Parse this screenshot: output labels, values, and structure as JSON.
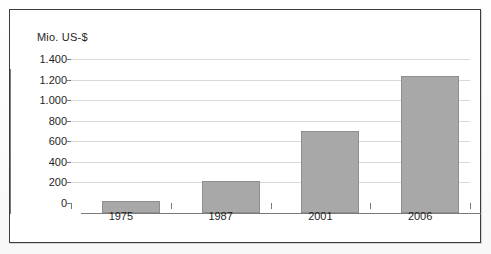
{
  "chart_data": {
    "type": "bar",
    "title": "",
    "subtitle": "",
    "xlabel": "",
    "ylabel": "Mio. US-$",
    "categories": [
      "1975",
      "1987",
      "2001",
      "2006"
    ],
    "values": [
      120,
      310,
      800,
      1330
    ],
    "ylim": [
      0,
      1400
    ],
    "ytick_labels": [
      "0",
      "200",
      "400",
      "600",
      "800",
      "1.000",
      "1.200",
      "1.400"
    ],
    "ytick_values": [
      0,
      200,
      400,
      600,
      800,
      1000,
      1200,
      1400
    ],
    "grid": true,
    "legend": false,
    "legend_position": "none",
    "series": [
      {
        "name": "",
        "values": [
          120,
          310,
          800,
          1330
        ],
        "color": "#a8a8a8"
      }
    ],
    "annotations": []
  },
  "colors": {
    "bar_fill": "#a8a8a8",
    "bar_stroke": "#8e8e8e",
    "gridline": "#d9d9d9",
    "axis": "#7a7a7a",
    "frame": "#3d3d3d",
    "text": "#1f1f1f",
    "background": "#ffffff"
  }
}
